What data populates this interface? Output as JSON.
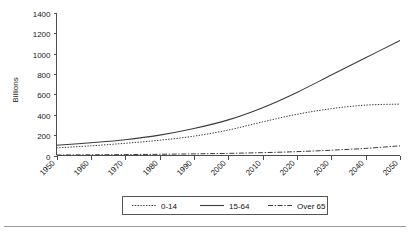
{
  "chart_data": {
    "type": "line",
    "title": "",
    "subtitle": "",
    "xlabel": "",
    "ylabel": "Billions",
    "x": [
      1950,
      1960,
      1970,
      1980,
      1990,
      2000,
      2010,
      2020,
      2030,
      2040,
      2050
    ],
    "xtick_labels": [
      "1950",
      "1960",
      "1970",
      "1980",
      "1990",
      "2000",
      "2010",
      "2020",
      "2030",
      "2040",
      "2050"
    ],
    "ytick_labels": [
      "0",
      "200",
      "400",
      "600",
      "800",
      "1000",
      "1200",
      "1400"
    ],
    "ytick_values": [
      0,
      200,
      400,
      600,
      800,
      1000,
      1200,
      1400
    ],
    "ylim": [
      0,
      1400
    ],
    "xlim": [
      1950,
      2050
    ],
    "grid": false,
    "legend_position": "bottom-center",
    "series": [
      {
        "name": "0-14",
        "style": "dotted",
        "color": "#3b3b3b",
        "values": [
          75,
          95,
          120,
          150,
          190,
          250,
          330,
          405,
          460,
          495,
          505
        ]
      },
      {
        "name": "15-64",
        "style": "solid",
        "color": "#3b3b3b",
        "values": [
          100,
          125,
          155,
          200,
          265,
          350,
          470,
          620,
          790,
          960,
          1130
        ]
      },
      {
        "name": "Over 65",
        "style": "dashdot",
        "color": "#6b6b6b",
        "values": [
          5,
          7,
          9,
          12,
          16,
          21,
          28,
          38,
          52,
          70,
          95
        ]
      }
    ]
  },
  "legend": {
    "items": [
      {
        "label": "0-14"
      },
      {
        "label": "15-64"
      },
      {
        "label": "Over 65"
      }
    ]
  },
  "axes": {
    "y_axis_title": "Billions"
  }
}
